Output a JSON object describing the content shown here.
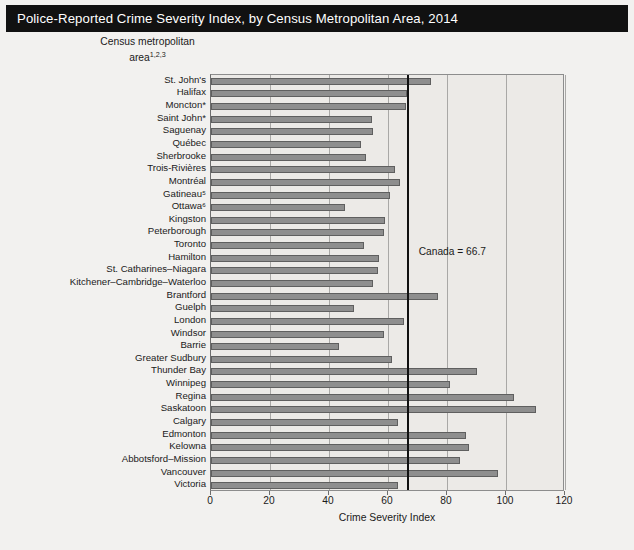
{
  "title": "Police-Reported Crime Severity Index, by Census Metropolitan Area, 2014",
  "yaxis_title_line1": "Census metropolitan",
  "yaxis_title_line2": "area",
  "yaxis_title_superscript": "1,2,3",
  "reference_label": "Canada = 66.7",
  "colors": {
    "title_bar": "#111111",
    "title_text": "#ffffff",
    "bar_fill": "#8e8e8e",
    "bar_edge": "#5f5f5f",
    "plot_bg": "#eceae7",
    "figure_bg": "#f2f1ef",
    "reference_line": "#111111",
    "gridline": "#a9a8a6"
  },
  "chart_data": {
    "type": "bar",
    "orientation": "horizontal",
    "title": "Police-Reported Crime Severity Index, by Census Metropolitan Area, 2014",
    "xlabel": "Crime Severity Index",
    "ylabel": "Census metropolitan area",
    "xlim": [
      0,
      120
    ],
    "xticks": [
      0,
      20,
      40,
      60,
      80,
      100,
      120
    ],
    "grid": true,
    "legend": null,
    "reference_line": {
      "label": "Canada = 66.7",
      "value": 66.7
    },
    "categories": [
      "St. John's",
      "Halifax",
      "Moncton*",
      "Saint John*",
      "Saguenay",
      "Québec",
      "Sherbrooke",
      "Trois-Rivières",
      "Montréal",
      "Gatineau⁵",
      "Ottawa⁶",
      "Kingston",
      "Peterborough",
      "Toronto",
      "Hamilton",
      "St. Catharines–Niagara",
      "Kitchener–Cambridge–Waterloo",
      "Brantford",
      "Guelph",
      "London",
      "Windsor",
      "Barrie",
      "Greater Sudbury",
      "Thunder Bay",
      "Winnipeg",
      "Regina",
      "Saskatoon",
      "Calgary",
      "Edmonton",
      "Kelowna",
      "Abbotsford–Mission",
      "Vancouver",
      "Victoria"
    ],
    "values": [
      74.5,
      66.4,
      66.2,
      54.7,
      55.0,
      50.7,
      52.5,
      62.5,
      64.0,
      60.8,
      45.3,
      59.0,
      58.5,
      52.0,
      57.0,
      56.5,
      55.0,
      77.0,
      48.5,
      65.5,
      58.5,
      43.5,
      61.5,
      90.0,
      81.0,
      102.7,
      110.0,
      63.5,
      86.5,
      87.5,
      84.5,
      97.3,
      63.4
    ]
  },
  "xaxis_title": "Crime Severity Index"
}
